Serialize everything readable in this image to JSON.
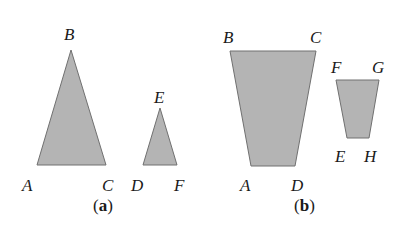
{
  "figure": {
    "colors": {
      "fill": "#b4b4b4",
      "stroke": "#707070",
      "text": "#1a1a1a"
    },
    "panel_a": {
      "caption": {
        "open": "(",
        "letter": "a",
        "close": ")"
      },
      "triangle_abc": {
        "points": "71,50 37,165 106,165",
        "labels": {
          "A": "A",
          "B": "B",
          "C": "C"
        }
      },
      "triangle_def": {
        "points": "160,108 143,165 177,165",
        "labels": {
          "D": "D",
          "E": "E",
          "F": "F"
        }
      }
    },
    "panel_b": {
      "caption": {
        "open": "(",
        "letter": "b",
        "close": ")"
      },
      "quad_abcd": {
        "points": "230,51 316,51 295,166 251,166",
        "labels": {
          "A": "A",
          "B": "B",
          "C": "C",
          "D": "D"
        }
      },
      "quad_efgh": {
        "points": "336,80 379,80 369,138 347,138",
        "labels": {
          "E": "E",
          "F": "F",
          "G": "G",
          "H": "H"
        }
      }
    }
  }
}
